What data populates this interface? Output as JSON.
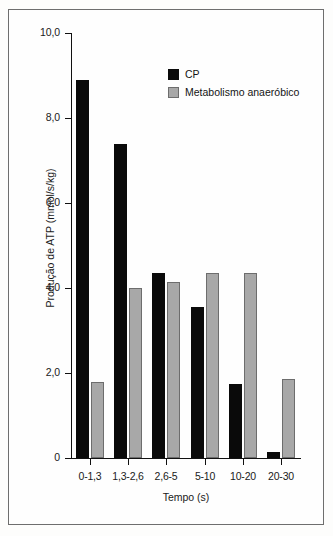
{
  "chart_data": {
    "type": "bar",
    "title": "",
    "xlabel": "Tempo (s)",
    "ylabel": "Produção de ATP (mmol/s/kg)",
    "categories": [
      "0-1,3",
      "1,3-2,6",
      "2,6-5",
      "5-10",
      "10-20",
      "20-30"
    ],
    "series": [
      {
        "name": "CP",
        "color": "#0a0a0a",
        "values": [
          8.9,
          7.4,
          4.35,
          3.55,
          1.75,
          0.15
        ]
      },
      {
        "name": "Metabolismo anaeróbico",
        "color": "#a8a8a8",
        "values": [
          1.8,
          4.0,
          4.15,
          4.35,
          4.35,
          1.85
        ]
      }
    ],
    "ylim": [
      0,
      10
    ],
    "yticks": [
      0,
      2,
      4,
      6,
      8,
      10
    ],
    "ytick_labels": [
      "0",
      "2,0",
      "4,0",
      "6,0",
      "8,0",
      "10,0"
    ],
    "grid": false,
    "legend_position": "top-right"
  },
  "legend": {
    "items": [
      {
        "label": "CP"
      },
      {
        "label": "Metabolismo anaeróbico"
      }
    ]
  }
}
